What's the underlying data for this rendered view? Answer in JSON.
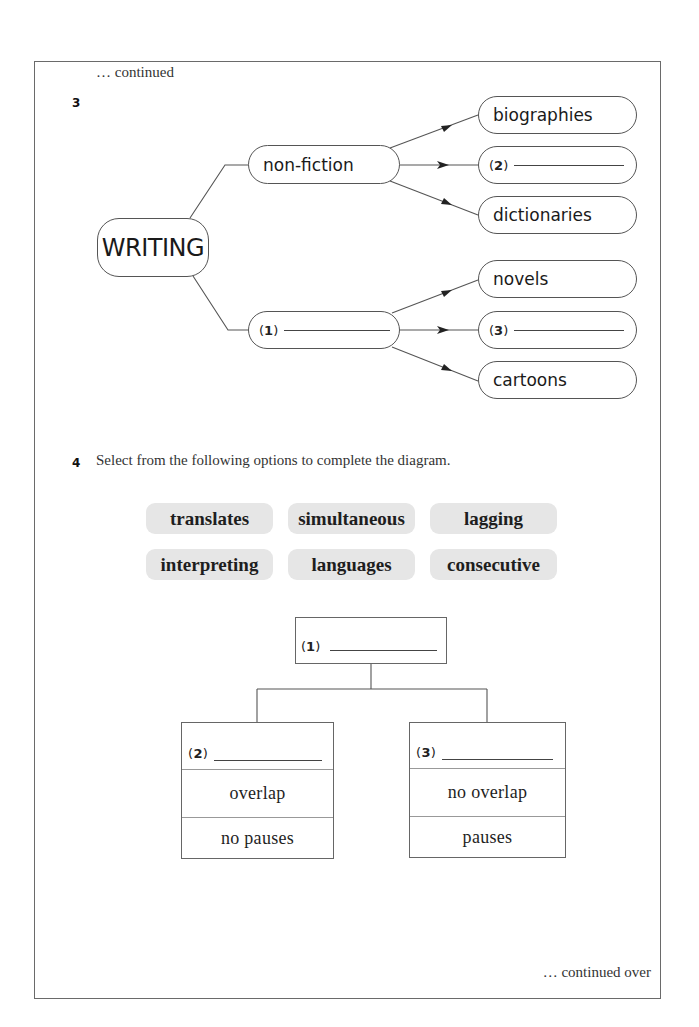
{
  "header": {
    "continued": "… continued"
  },
  "question3": {
    "number": "3",
    "root": "WRITING",
    "branches": [
      {
        "label": "non-fiction",
        "blank_number": null,
        "children": [
          {
            "label": "biographies",
            "blank_number": null
          },
          {
            "label": "",
            "blank_number": "2"
          },
          {
            "label": "dictionaries",
            "blank_number": null
          }
        ]
      },
      {
        "label": "",
        "blank_number": "1",
        "children": [
          {
            "label": "novels",
            "blank_number": null
          },
          {
            "label": "",
            "blank_number": "3"
          },
          {
            "label": "cartoons",
            "blank_number": null
          }
        ]
      }
    ]
  },
  "question4": {
    "number": "4",
    "instruction": "Select from the following options to complete the diagram.",
    "options": [
      "translates",
      "simultaneous",
      "lagging",
      "interpreting",
      "languages",
      "consecutive"
    ],
    "tree": {
      "top": {
        "blank_number": "1"
      },
      "left": {
        "blank_number": "2",
        "rows": [
          "overlap",
          "no pauses"
        ]
      },
      "right": {
        "blank_number": "3",
        "rows": [
          "no overlap",
          "pauses"
        ]
      }
    }
  },
  "footer": {
    "continued_over": "… continued over"
  },
  "paren_open": "(",
  "paren_close": ")"
}
